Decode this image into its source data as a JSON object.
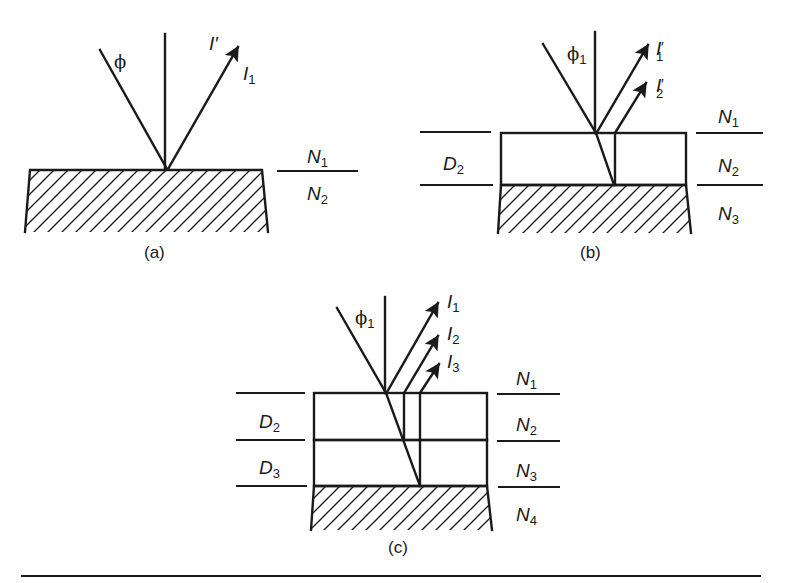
{
  "figure": {
    "panels": [
      {
        "id": "a",
        "caption": "(a)",
        "angle_label": "ϕ",
        "angle_sub": "",
        "beams": [
          {
            "label": "I",
            "sub": "",
            "prime": "′"
          },
          {
            "label": "I",
            "sub": "1",
            "prime": ""
          }
        ],
        "media": [
          {
            "label": "N",
            "sub": "1"
          },
          {
            "label": "N",
            "sub": "2"
          }
        ],
        "thickness_labels": []
      },
      {
        "id": "b",
        "caption": "(b)",
        "angle_label": "ϕ",
        "angle_sub": "1",
        "beams": [
          {
            "label": "I",
            "sub": "1",
            "prime": "′"
          },
          {
            "label": "I",
            "sub": "2",
            "prime": "′"
          }
        ],
        "media": [
          {
            "label": "N",
            "sub": "1"
          },
          {
            "label": "N",
            "sub": "2"
          },
          {
            "label": "N",
            "sub": "3"
          }
        ],
        "thickness_labels": [
          {
            "label": "D",
            "sub": "2"
          }
        ]
      },
      {
        "id": "c",
        "caption": "(c)",
        "angle_label": "ϕ",
        "angle_sub": "1",
        "beams": [
          {
            "label": "I",
            "sub": "1",
            "prime": ""
          },
          {
            "label": "I",
            "sub": "2",
            "prime": ""
          },
          {
            "label": "I",
            "sub": "3",
            "prime": ""
          }
        ],
        "media": [
          {
            "label": "N",
            "sub": "1"
          },
          {
            "label": "N",
            "sub": "2"
          },
          {
            "label": "N",
            "sub": "3"
          },
          {
            "label": "N",
            "sub": "4"
          }
        ],
        "thickness_labels": [
          {
            "label": "D",
            "sub": "2"
          },
          {
            "label": "D",
            "sub": "3"
          }
        ]
      }
    ],
    "colors": {
      "ink": "#1a1a1a",
      "background": "#ffffff"
    }
  }
}
